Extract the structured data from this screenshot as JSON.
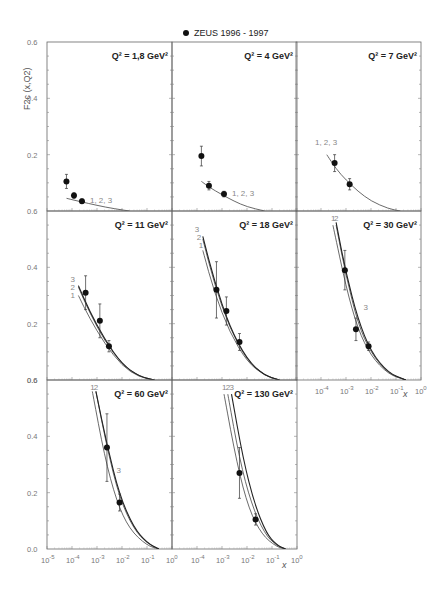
{
  "chart_data": {
    "type": "scatter",
    "title": "",
    "legend": [
      {
        "marker": "filled-circle",
        "label": "ZEUS 1996 - 1997"
      }
    ],
    "xlabel": "x",
    "ylabel": "F2c (x,Q2)",
    "xscale": "log",
    "xlim": [
      1e-05,
      1
    ],
    "ylim": [
      0.0,
      0.6
    ],
    "x_tick_labels": [
      "10-5",
      "10-4",
      "10-3",
      "10-2",
      "10-1",
      "100"
    ],
    "y_tick_labels": [
      "0.0",
      "0.2",
      "0.4",
      "0.6"
    ],
    "grid": false,
    "layout": "3x3 grid, last cell empty",
    "panels": [
      {
        "q2_label": "Q2 = 1,8 GeV2",
        "data": [
          {
            "x": 6e-05,
            "y": 0.105,
            "err": 0.025
          },
          {
            "x": 0.00012,
            "y": 0.055,
            "err": 0.01
          },
          {
            "x": 0.00025,
            "y": 0.035,
            "err": 0.008
          }
        ],
        "curves": [
          {
            "name": "1,2,3",
            "points": [
              [
                6e-05,
                0.045
              ],
              [
                0.0002,
                0.034
              ],
              [
                0.001,
                0.02
              ],
              [
                0.005,
                0.008
              ],
              [
                0.02,
                0.0
              ]
            ]
          }
        ],
        "curve_label": "1, 2, 3"
      },
      {
        "q2_label": "Q2 = 4 GeV2",
        "data": [
          {
            "x": 0.00015,
            "y": 0.195,
            "err": 0.035
          },
          {
            "x": 0.0003,
            "y": 0.09,
            "err": 0.015
          },
          {
            "x": 0.0012,
            "y": 0.06,
            "err": 0.01
          }
        ],
        "curves": [
          {
            "name": "1,2,3",
            "points": [
              [
                0.00015,
                0.105
              ],
              [
                0.0003,
                0.085
              ],
              [
                0.001,
                0.058
              ],
              [
                0.003,
                0.035
              ],
              [
                0.01,
                0.015
              ],
              [
                0.05,
                0.0
              ]
            ]
          }
        ],
        "curve_label": "1, 2, 3"
      },
      {
        "q2_label": "Q2 = 7 GeV2",
        "data": [
          {
            "x": 0.00035,
            "y": 0.17,
            "err": 0.03
          },
          {
            "x": 0.0014,
            "y": 0.095,
            "err": 0.02
          }
        ],
        "curves": [
          {
            "name": "1,2,3",
            "points": [
              [
                0.00017,
                0.2
              ],
              [
                0.0004,
                0.15
              ],
              [
                0.001,
                0.11
              ],
              [
                0.003,
                0.07
              ],
              [
                0.01,
                0.035
              ],
              [
                0.05,
                0.008
              ],
              [
                0.15,
                0.0
              ]
            ]
          }
        ],
        "curve_label": "1, 2, 3"
      },
      {
        "q2_label": "Q2 = 11 GeV2",
        "data": [
          {
            "x": 0.00035,
            "y": 0.31,
            "err": 0.06
          },
          {
            "x": 0.0013,
            "y": 0.21,
            "err": 0.06
          },
          {
            "x": 0.003,
            "y": 0.12,
            "err": 0.02
          }
        ],
        "curves": [
          {
            "name": "1",
            "points": [
              [
                0.00018,
                0.3
              ],
              [
                0.0005,
                0.22
              ],
              [
                0.002,
                0.13
              ],
              [
                0.01,
                0.05
              ],
              [
                0.05,
                0.01
              ],
              [
                0.2,
                0.0
              ]
            ]
          },
          {
            "name": "2",
            "points": [
              [
                0.00018,
                0.33
              ],
              [
                0.0005,
                0.24
              ],
              [
                0.002,
                0.14
              ],
              [
                0.01,
                0.055
              ],
              [
                0.05,
                0.012
              ],
              [
                0.2,
                0.0
              ]
            ]
          },
          {
            "name": "3",
            "points": [
              [
                0.00018,
                0.335
              ],
              [
                0.0005,
                0.245
              ],
              [
                0.002,
                0.145
              ],
              [
                0.01,
                0.056
              ],
              [
                0.05,
                0.012
              ],
              [
                0.2,
                0.0
              ]
            ]
          }
        ],
        "curve_labels": [
          "3",
          "2",
          "1"
        ]
      },
      {
        "q2_label": "Q2 = 18 GeV2",
        "data": [
          {
            "x": 0.0006,
            "y": 0.32,
            "err": 0.1
          },
          {
            "x": 0.0015,
            "y": 0.245,
            "err": 0.05
          },
          {
            "x": 0.005,
            "y": 0.135,
            "err": 0.03
          }
        ],
        "curves": [
          {
            "name": "1",
            "points": [
              [
                0.00017,
                0.46
              ],
              [
                0.0005,
                0.31
              ],
              [
                0.002,
                0.17
              ],
              [
                0.01,
                0.065
              ],
              [
                0.05,
                0.015
              ],
              [
                0.2,
                0.0
              ]
            ]
          },
          {
            "name": "2",
            "points": [
              [
                0.00017,
                0.5
              ],
              [
                0.0005,
                0.34
              ],
              [
                0.002,
                0.185
              ],
              [
                0.01,
                0.07
              ],
              [
                0.05,
                0.016
              ],
              [
                0.2,
                0.0
              ]
            ]
          },
          {
            "name": "3",
            "points": [
              [
                0.00017,
                0.51
              ],
              [
                0.0005,
                0.35
              ],
              [
                0.002,
                0.19
              ],
              [
                0.01,
                0.072
              ],
              [
                0.05,
                0.016
              ],
              [
                0.2,
                0.0
              ]
            ]
          }
        ],
        "curve_labels": [
          "3",
          "2",
          "1"
        ]
      },
      {
        "q2_label": "Q2 = 30 GeV2",
        "data": [
          {
            "x": 0.0009,
            "y": 0.39,
            "err": 0.07
          },
          {
            "x": 0.0025,
            "y": 0.18,
            "err": 0.04
          },
          {
            "x": 0.008,
            "y": 0.12,
            "err": 0.015
          }
        ],
        "curves": [
          {
            "name": "1",
            "points": [
              [
                0.0003,
                0.55
              ],
              [
                0.001,
                0.33
              ],
              [
                0.003,
                0.18
              ],
              [
                0.01,
                0.085
              ],
              [
                0.05,
                0.02
              ],
              [
                0.25,
                0.0
              ]
            ]
          },
          {
            "name": "2",
            "points": [
              [
                0.0004,
                0.55
              ],
              [
                0.001,
                0.37
              ],
              [
                0.003,
                0.2
              ],
              [
                0.01,
                0.095
              ],
              [
                0.05,
                0.022
              ],
              [
                0.25,
                0.0
              ]
            ]
          },
          {
            "name": "3",
            "points": [
              [
                0.0004,
                0.56
              ],
              [
                0.001,
                0.38
              ],
              [
                0.003,
                0.215
              ],
              [
                0.01,
                0.1
              ],
              [
                0.05,
                0.024
              ],
              [
                0.25,
                0.0
              ]
            ]
          }
        ],
        "curve_labels": [
          "1",
          "2",
          "3"
        ]
      },
      {
        "q2_label": "Q2 = 60 GeV2",
        "data": [
          {
            "x": 0.0025,
            "y": 0.36,
            "err": 0.12
          },
          {
            "x": 0.008,
            "y": 0.165,
            "err": 0.03
          }
        ],
        "curves": [
          {
            "name": "1",
            "points": [
              [
                0.00065,
                0.56
              ],
              [
                0.002,
                0.33
              ],
              [
                0.006,
                0.17
              ],
              [
                0.02,
                0.07
              ],
              [
                0.1,
                0.012
              ],
              [
                0.3,
                0.0
              ]
            ]
          },
          {
            "name": "2",
            "points": [
              [
                0.0009,
                0.56
              ],
              [
                0.0025,
                0.36
              ],
              [
                0.008,
                0.18
              ],
              [
                0.03,
                0.07
              ],
              [
                0.1,
                0.02
              ],
              [
                0.3,
                0.0
              ]
            ]
          },
          {
            "name": "3",
            "points": [
              [
                0.0009,
                0.56
              ],
              [
                0.0025,
                0.37
              ],
              [
                0.008,
                0.19
              ],
              [
                0.03,
                0.075
              ],
              [
                0.1,
                0.022
              ],
              [
                0.3,
                0.0
              ]
            ]
          }
        ],
        "curve_labels": [
          "1",
          "2",
          "3"
        ]
      },
      {
        "q2_label": "Q2 = 130 GeV2",
        "data": [
          {
            "x": 0.005,
            "y": 0.27,
            "err": 0.09
          },
          {
            "x": 0.022,
            "y": 0.105,
            "err": 0.02
          }
        ],
        "curves": [
          {
            "name": "1",
            "points": [
              [
                0.0012,
                0.55
              ],
              [
                0.004,
                0.3
              ],
              [
                0.012,
                0.14
              ],
              [
                0.04,
                0.05
              ],
              [
                0.15,
                0.008
              ],
              [
                0.35,
                0.0
              ]
            ]
          },
          {
            "name": "2",
            "points": [
              [
                0.0017,
                0.55
              ],
              [
                0.005,
                0.32
              ],
              [
                0.015,
                0.16
              ],
              [
                0.05,
                0.055
              ],
              [
                0.15,
                0.012
              ],
              [
                0.35,
                0.0
              ]
            ]
          },
          {
            "name": "3",
            "points": [
              [
                0.0024,
                0.55
              ],
              [
                0.007,
                0.32
              ],
              [
                0.02,
                0.16
              ],
              [
                0.06,
                0.055
              ],
              [
                0.15,
                0.015
              ],
              [
                0.35,
                0.0
              ]
            ]
          }
        ],
        "curve_labels": [
          "1",
          "2",
          "3"
        ]
      }
    ]
  }
}
